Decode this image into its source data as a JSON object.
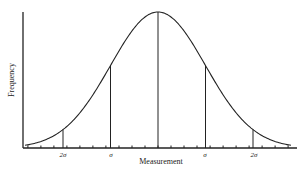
{
  "chart_data": {
    "type": "line",
    "title": "",
    "xlabel": "Measurement",
    "ylabel": "Frequency",
    "x_tick_labels": [
      "2σ",
      "σ",
      "σ",
      "2σ"
    ],
    "marked_positions_sigma": [
      -2,
      -1,
      0,
      1,
      2
    ],
    "curve": {
      "mean": 0,
      "sd": 1,
      "x_range": [
        -2.8,
        2.8
      ]
    },
    "grid": false,
    "legend": null
  },
  "labels": {
    "xlabel": "Measurement",
    "ylabel": "Frequency",
    "tick_left_2sigma": "2σ",
    "tick_left_sigma": "σ",
    "tick_right_sigma": "σ",
    "tick_right_2sigma": "2σ"
  },
  "colors": {
    "line": "#222222",
    "background": "#ffffff"
  }
}
